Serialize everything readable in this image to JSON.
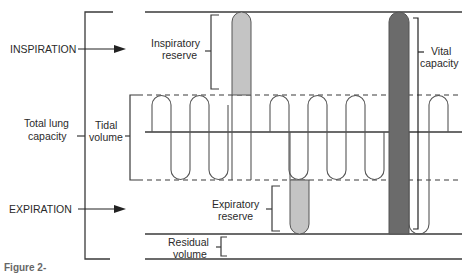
{
  "figure": {
    "caption_fragment": "Figure 2-",
    "colors": {
      "line": "#3a3a3a",
      "trace": "#555555",
      "inspiratory_reserve_fill": "#c4c4c4",
      "expiratory_reserve_fill": "#c4c4c4",
      "vital_capacity_fill": "#6b6b6b"
    }
  },
  "labels": {
    "inspiration": "INSPIRATION",
    "expiration": "EXPIRATION",
    "total_lung_capacity_1": "Total lung",
    "total_lung_capacity_2": "capacity",
    "tidal_volume_1": "Tidal",
    "tidal_volume_2": "volume",
    "inspiratory_reserve_1": "Inspiratory",
    "inspiratory_reserve_2": "reserve",
    "expiratory_reserve_1": "Expiratory",
    "expiratory_reserve_2": "reserve",
    "residual_volume_1": "Residual",
    "residual_volume_2": "volume",
    "vital_capacity_1": "Vital",
    "vital_capacity_2": "capacity"
  }
}
